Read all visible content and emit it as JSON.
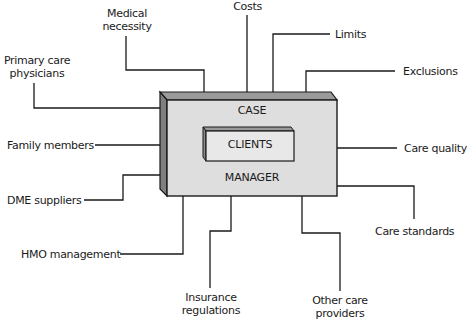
{
  "diagram": {
    "type": "hub-and-spoke",
    "center": {
      "outer_top_label": "CASE",
      "outer_bottom_label": "MANAGER",
      "inner_label": "CLIENTS",
      "fill_color": "#dcdcdc",
      "side_color": "#8a8a8a"
    },
    "nodes": [
      {
        "id": "medical-necessity",
        "line1": "Medical",
        "line2": "necessity"
      },
      {
        "id": "costs",
        "label": "Costs"
      },
      {
        "id": "limits",
        "label": "Limits"
      },
      {
        "id": "exclusions",
        "label": "Exclusions"
      },
      {
        "id": "primary-care-physicians",
        "line1": "Primary care",
        "line2": "physicians"
      },
      {
        "id": "family-members",
        "label": "Family members"
      },
      {
        "id": "dme-suppliers",
        "label": "DME suppliers"
      },
      {
        "id": "hmo-management",
        "label": "HMO management"
      },
      {
        "id": "insurance-regulations",
        "line1": "Insurance",
        "line2": "regulations"
      },
      {
        "id": "other-care-providers",
        "line1": "Other care",
        "line2": "providers"
      },
      {
        "id": "care-quality",
        "label": "Care quality"
      },
      {
        "id": "care-standards",
        "label": "Care standards"
      }
    ]
  }
}
